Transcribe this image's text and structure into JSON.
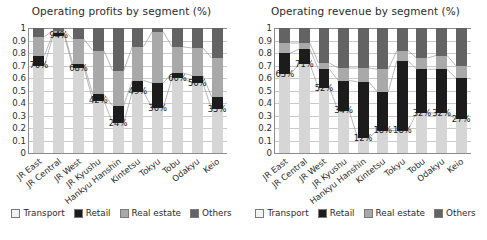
{
  "charts": [
    {
      "title": "Operating profits by segment (%)",
      "id": "operating-profits"
    },
    {
      "title": "Operating revenue by segment (%)",
      "id": "operating-revenue"
    }
  ],
  "legend": {
    "items": [
      {
        "label": "Transport",
        "color": "#f2f2f2",
        "key": "transport"
      },
      {
        "label": "Retail",
        "color": "#1c1c1c",
        "key": "retail"
      },
      {
        "label": "Real estate",
        "color": "#a9a9a9",
        "key": "realestate"
      },
      {
        "label": "Others",
        "color": "#636363",
        "key": "others"
      }
    ]
  },
  "yticks": [
    "1",
    "0.9",
    "0.8",
    "0.7",
    "0.6",
    "0.5",
    "0.4",
    "0.3",
    "0.2",
    "0.1",
    "0"
  ],
  "chart_data": [
    {
      "type": "bar",
      "stacked": true,
      "normalized": true,
      "title": "Operating profits by segment (%)",
      "xlabel": "",
      "ylabel": "",
      "ylim": [
        0,
        1
      ],
      "ytick_values": [
        0,
        0.1,
        0.2,
        0.3,
        0.4,
        0.5,
        0.6,
        0.7,
        0.8,
        0.9,
        1
      ],
      "grid": true,
      "legend_position": "bottom",
      "categories": [
        "JR East",
        "JR Central",
        "JR West",
        "JR Kyushu",
        "Hankyu Hanshin",
        "Kintetsu",
        "Tokyu",
        "Tobu",
        "Odakyu",
        "Keio"
      ],
      "series": [
        {
          "name": "Transport",
          "color": "#d6d6d6",
          "values": [
            0.7,
            0.94,
            0.68,
            0.42,
            0.24,
            0.49,
            0.36,
            0.6,
            0.56,
            0.35
          ]
        },
        {
          "name": "Retail",
          "color": "#1c1c1c",
          "values": [
            0.08,
            0.02,
            0.03,
            0.05,
            0.14,
            0.09,
            0.2,
            0.04,
            0.06,
            0.1
          ]
        },
        {
          "name": "Real estate",
          "color": "#a9a9a9",
          "values": [
            0.15,
            0.02,
            0.2,
            0.35,
            0.28,
            0.27,
            0.41,
            0.21,
            0.22,
            0.31
          ]
        },
        {
          "name": "Others",
          "color": "#636363",
          "values": [
            0.07,
            0.02,
            0.09,
            0.18,
            0.34,
            0.15,
            0.03,
            0.15,
            0.16,
            0.24
          ]
        }
      ],
      "data_labels": [
        "70%",
        "94%",
        "68%",
        "42%",
        "24%",
        "49%",
        "36%",
        "60%",
        "56%",
        "35%"
      ]
    },
    {
      "type": "bar",
      "stacked": true,
      "normalized": true,
      "title": "Operating revenue by segment (%)",
      "xlabel": "",
      "ylabel": "",
      "ylim": [
        0,
        1
      ],
      "ytick_values": [
        0,
        0.1,
        0.2,
        0.3,
        0.4,
        0.5,
        0.6,
        0.7,
        0.8,
        0.9,
        1
      ],
      "grid": true,
      "legend_position": "bottom",
      "categories": [
        "JR East",
        "JR Central",
        "JR West",
        "JR Kyushu",
        "Hankyu Hanshin",
        "Kintetsu",
        "Tokyu",
        "Tobu",
        "Odakyu",
        "Keio"
      ],
      "series": [
        {
          "name": "Transport",
          "color": "#d6d6d6",
          "values": [
            0.63,
            0.71,
            0.52,
            0.34,
            0.12,
            0.18,
            0.18,
            0.32,
            0.32,
            0.27
          ]
        },
        {
          "name": "Retail",
          "color": "#1c1c1c",
          "values": [
            0.17,
            0.12,
            0.15,
            0.24,
            0.45,
            0.31,
            0.56,
            0.35,
            0.35,
            0.33
          ]
        },
        {
          "name": "Real estate",
          "color": "#a9a9a9",
          "values": [
            0.08,
            0.05,
            0.05,
            0.1,
            0.11,
            0.18,
            0.08,
            0.09,
            0.11,
            0.1
          ]
        },
        {
          "name": "Others",
          "color": "#636363",
          "values": [
            0.12,
            0.12,
            0.28,
            0.32,
            0.32,
            0.33,
            0.18,
            0.24,
            0.22,
            0.3
          ]
        }
      ],
      "data_labels": [
        "63%",
        "71%",
        "52%",
        "34%",
        "12%",
        "18%",
        "18%",
        "32%",
        "32%",
        "27%"
      ]
    }
  ]
}
